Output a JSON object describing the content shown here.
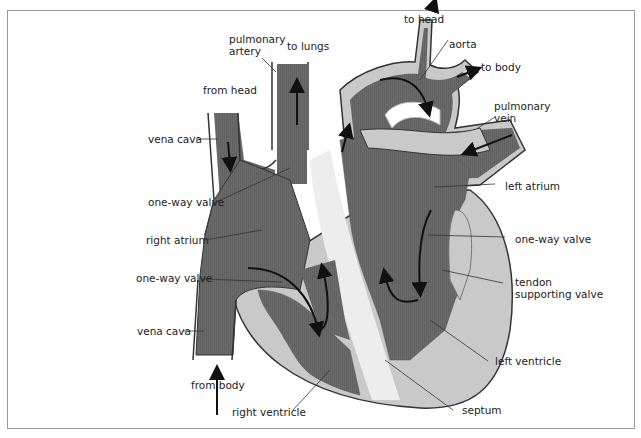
{
  "diagram": {
    "colors": {
      "blood": "#6a6a6a",
      "wall": "#c9c9c9",
      "vessel_edge": "#ffffff",
      "outline": "#333333",
      "arrow": "#111111",
      "frame": "#9a9a9a"
    },
    "labels": {
      "pulmonary_artery": "pulmonary artery",
      "pulmonary_artery_l1": "pulmonary",
      "pulmonary_artery_l2": "artery",
      "to_lungs": "to lungs",
      "from_head": "from head",
      "vena_cava_top": "vena cava",
      "one_way_valve_upper": "one-way valve",
      "right_atrium": "right atrium",
      "one_way_valve_lower_left": "one-way valve",
      "vena_cava_bottom": "vena cava",
      "from_body": "from body",
      "right_ventricle": "right ventricle",
      "septum": "septum",
      "left_ventricle": "left ventricle",
      "tendon_supporting_valve_l1": "tendon",
      "tendon_supporting_valve_l2": "supporting valve",
      "one_way_valve_right": "one-way valve",
      "left_atrium": "left atrium",
      "pulmonary_vein_l1": "pulmonary",
      "pulmonary_vein_l2": "vein",
      "to_body": "to body",
      "aorta": "aorta",
      "to_head": "to head"
    }
  }
}
